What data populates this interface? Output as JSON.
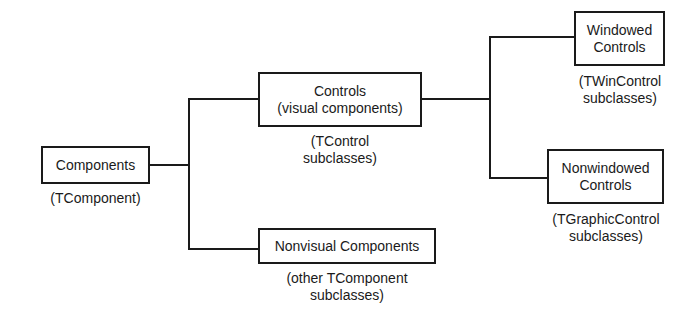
{
  "diagram": {
    "type": "hierarchy",
    "nodes": {
      "components": {
        "label": "Components",
        "caption": [
          "(TComponent)"
        ]
      },
      "controls": {
        "label": [
          "Controls",
          "(visual components)"
        ],
        "caption": [
          "(TControl",
          "subclasses)"
        ]
      },
      "nonvisual": {
        "label": "Nonvisual Components",
        "caption": [
          "(other TComponent",
          "subclasses)"
        ]
      },
      "windowed": {
        "label": [
          "Windowed",
          "Controls"
        ],
        "caption": [
          "(TWinControl",
          "subclasses)"
        ]
      },
      "nonwindowed": {
        "label": [
          "Nonwindowed",
          "Controls"
        ],
        "caption": [
          "(TGraphicControl",
          "subclasses)"
        ]
      }
    },
    "edges": [
      [
        "components",
        "controls"
      ],
      [
        "components",
        "nonvisual"
      ],
      [
        "controls",
        "windowed"
      ],
      [
        "controls",
        "nonwindowed"
      ]
    ],
    "line_color": "#1a1a1a"
  }
}
